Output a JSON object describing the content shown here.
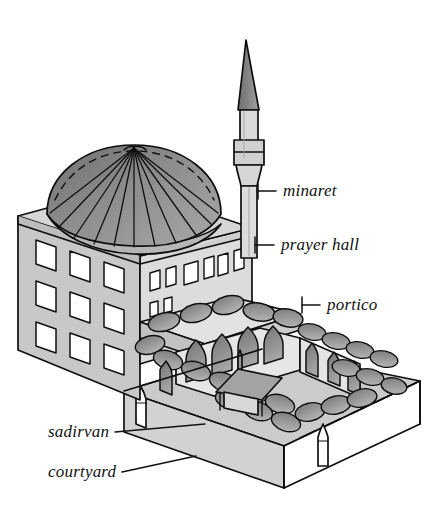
{
  "figure": {
    "style": "hand-drawn pencil line drawing, grayscale",
    "background_color": "#ffffff",
    "ink_color": "#111111"
  },
  "labels": [
    {
      "id": "minaret",
      "text": "minaret",
      "x": 283,
      "y": 181,
      "leader": {
        "from": [
          276,
          191
        ],
        "to": [
          258,
          191
        ],
        "tick": [
          258,
          183,
          258,
          199
        ]
      }
    },
    {
      "id": "prayer_hall",
      "text": "prayer hall",
      "x": 281,
      "y": 235,
      "leader": {
        "from": [
          274,
          245
        ],
        "to": [
          255,
          245
        ],
        "tick": [
          255,
          237,
          255,
          253
        ]
      }
    },
    {
      "id": "portico",
      "text": "portico",
      "x": 327,
      "y": 295,
      "leader": {
        "from": [
          320,
          305
        ],
        "to": [
          302,
          305
        ],
        "tick": [
          302,
          297,
          302,
          313
        ]
      }
    },
    {
      "id": "sadirvan",
      "text": "sadirvan",
      "x": 48,
      "y": 422,
      "leader": {
        "from": [
          115,
          432
        ],
        "to": [
          205,
          424
        ],
        "tick": null
      }
    },
    {
      "id": "courtyard",
      "text": "courtyard",
      "x": 48,
      "y": 462,
      "leader": {
        "from": [
          122,
          472
        ],
        "to": [
          196,
          456
        ],
        "tick": null
      }
    }
  ],
  "parts": {
    "minaret": {
      "name": "minaret",
      "elements": [
        "conical spire",
        "upper shaft",
        "serefe balcony ring",
        "lower shaft",
        "base"
      ],
      "spire_fill": "#8e8e8e",
      "shaft_fill": "#d8d8d8"
    },
    "dome": {
      "name": "central dome",
      "rib_count": 13,
      "fill": "#8b8b8b",
      "drum_fill": "#bdbdbd"
    },
    "prayer_hall": {
      "name": "prayer hall",
      "left_facade_window_rows": 3,
      "left_facade_window_cols": 3,
      "front_facade_window_count": 7,
      "wall_fill_left": "#c9c9c9",
      "wall_fill_front": "#d9d9d9"
    },
    "portico": {
      "name": "portico",
      "small_dome_count": 7,
      "arch_count": 6,
      "dome_fill": "#9a9a9a"
    },
    "courtyard": {
      "name": "courtyard",
      "floor_fill": "#cfcfcf",
      "wall_fill": "#ffffff",
      "front_edge": "dashed",
      "gate_finials": 2,
      "arcade_domes_right": 12,
      "arcade_domes_front": 8
    },
    "sadirvan": {
      "name": "sadirvan",
      "description": "ablution fountain with pointed canopy roof",
      "canopy_fill": "#9e9e9e"
    }
  },
  "palette": {
    "ink": "#111111",
    "dome_gray": "#8b8b8b",
    "wall_light": "#d9d9d9",
    "wall_mid": "#c4c4c4",
    "floor_gray": "#cfcfcf",
    "white": "#ffffff"
  }
}
